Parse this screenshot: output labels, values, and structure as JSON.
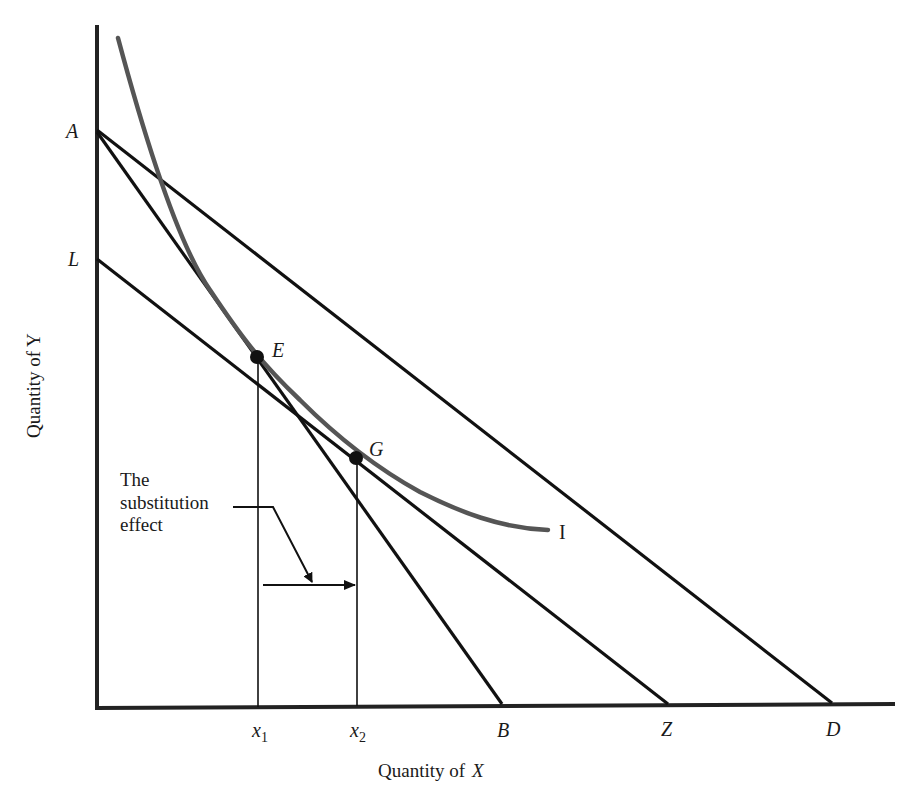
{
  "diagram": {
    "type": "indifference-curve / budget-line diagram",
    "axes": {
      "x_label_prefix": "Quantity of",
      "x_label_var": "X",
      "y_label": "Quantity of Y"
    },
    "intercept_labels": {
      "A": "A",
      "L": "L",
      "B": "B",
      "Z": "Z",
      "D": "D"
    },
    "points": {
      "E": "E",
      "G": "G"
    },
    "curve_label": "I",
    "tick_labels": {
      "x1_base": "x",
      "x1_sub": "1",
      "x2_base": "x",
      "x2_sub": "2"
    },
    "annotation": {
      "line1": "The",
      "line2": "substitution",
      "line3": "effect"
    },
    "colors": {
      "lines": "#111111",
      "curve": "#555555",
      "background": "#ffffff"
    }
  }
}
